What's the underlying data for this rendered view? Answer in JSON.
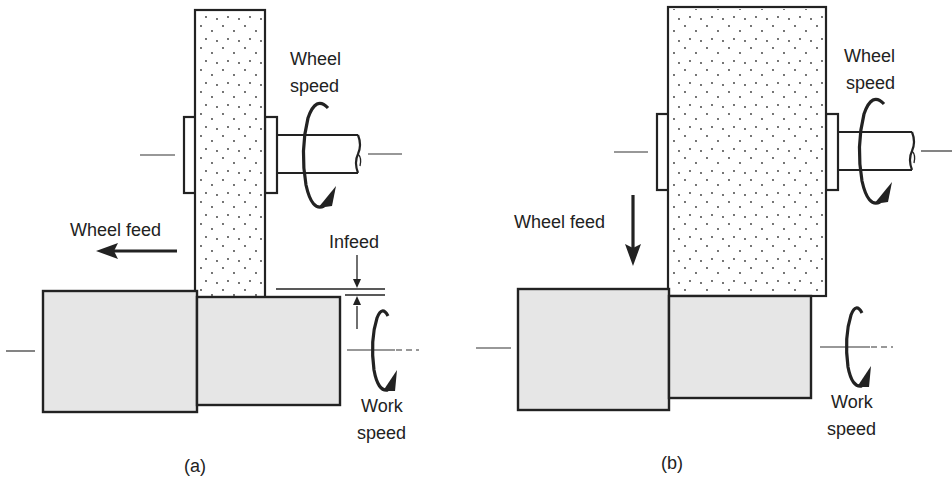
{
  "figure": {
    "panels": [
      {
        "id": "a",
        "caption": "(a)",
        "labels": {
          "wheel_speed_line1": "Wheel",
          "wheel_speed_line2": "speed",
          "wheel_feed": "Wheel feed",
          "infeed": "Infeed",
          "work_speed_line1": "Work",
          "work_speed_line2": "speed"
        },
        "wheel_feed_direction": "left"
      },
      {
        "id": "b",
        "caption": "(b)",
        "labels": {
          "wheel_speed_line1": "Wheel",
          "wheel_speed_line2": "speed",
          "wheel_feed": "Wheel feed",
          "work_speed_line1": "Work",
          "work_speed_line2": "speed"
        },
        "wheel_feed_direction": "down"
      }
    ],
    "colors": {
      "line": "#222222",
      "workpiece_fill": "#e6e6e6",
      "wheel_fill": "#ffffff",
      "background": "#ffffff"
    }
  }
}
